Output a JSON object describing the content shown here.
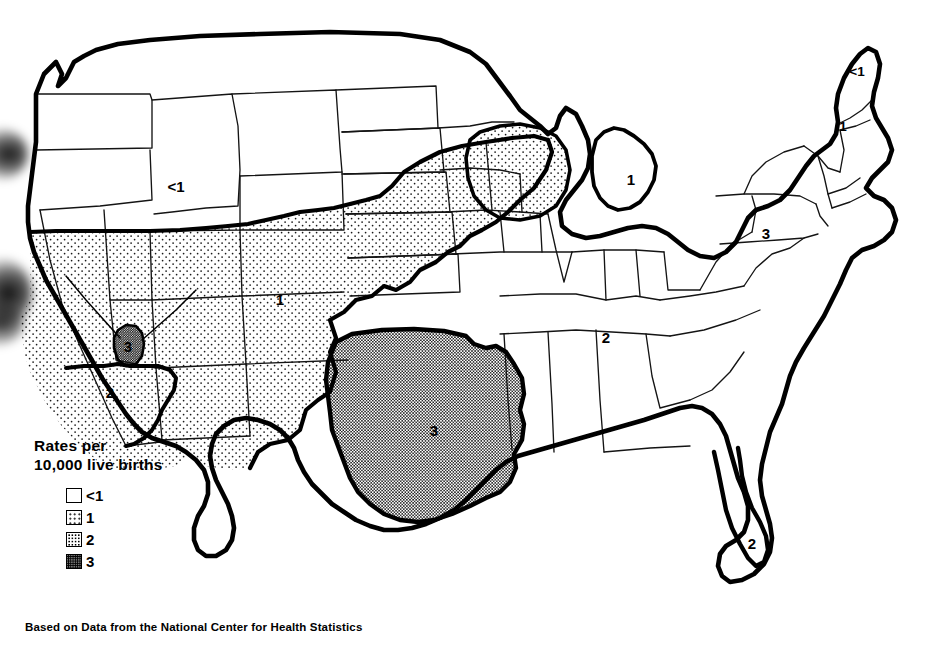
{
  "figure": {
    "kind": "choropleth-map",
    "region": "United States",
    "background_color": "#ffffff",
    "ink_color": "#000000"
  },
  "legend": {
    "title": "Rates per\n10,000 live births",
    "title_line1": "Rates per",
    "title_line2": "10,000 live births",
    "entries": [
      {
        "label": "<1",
        "level": 0,
        "pattern": "white"
      },
      {
        "label": "1",
        "level": 1,
        "pattern": "sparse-dots"
      },
      {
        "label": "2",
        "level": 2,
        "pattern": "medium-dots"
      },
      {
        "label": "3",
        "level": 3,
        "pattern": "dense-dots"
      }
    ]
  },
  "source_note": "Based on Data from the National Center for Health Statistics",
  "map_labels": [
    {
      "id": "pacific-northwest",
      "text": "<1",
      "x": 176,
      "y": 186,
      "size": "normal"
    },
    {
      "id": "great-plains",
      "text": "1",
      "x": 280,
      "y": 299,
      "size": "normal"
    },
    {
      "id": "nevada-small",
      "text": "3",
      "x": 128,
      "y": 346,
      "size": "normal"
    },
    {
      "id": "southern-california",
      "text": "2",
      "x": 110,
      "y": 392,
      "size": "normal"
    },
    {
      "id": "texas-oklahoma",
      "text": "3",
      "x": 434,
      "y": 430,
      "size": "normal"
    },
    {
      "id": "michigan",
      "text": "1",
      "x": 631,
      "y": 179,
      "size": "normal"
    },
    {
      "id": "kentucky",
      "text": "2",
      "x": 606,
      "y": 337,
      "size": "normal"
    },
    {
      "id": "florida",
      "text": "2",
      "x": 752,
      "y": 543,
      "size": "normal"
    },
    {
      "id": "pennsylvania",
      "text": "3",
      "x": 766,
      "y": 233,
      "size": "normal"
    },
    {
      "id": "maine",
      "text": "<1",
      "x": 857,
      "y": 71,
      "size": "small"
    },
    {
      "id": "new-hampshire",
      "text": "1",
      "x": 843,
      "y": 126,
      "size": "small"
    }
  ],
  "chart_data": {
    "type": "map",
    "title": "Rates per 10,000 live births",
    "subtitle": "Based on Data from the National Center for Health Statistics",
    "legend_position": "bottom-left",
    "scale": {
      "kind": "ordinal-choropleth",
      "classes": [
        {
          "label": "<1",
          "level": 0,
          "fill": "white"
        },
        {
          "label": "1",
          "level": 1,
          "fill": "sparse-dots"
        },
        {
          "label": "2",
          "level": 2,
          "fill": "medium-dots"
        },
        {
          "label": "3",
          "level": 3,
          "fill": "dense-dots"
        }
      ]
    },
    "labeled_regions": [
      {
        "region": "Pacific Northwest / Northern Rockies",
        "value": "<1"
      },
      {
        "region": "Great Plains / Mountain West",
        "value": "1"
      },
      {
        "region": "Nevada (small area)",
        "value": "3"
      },
      {
        "region": "Southern California",
        "value": "2"
      },
      {
        "region": "Texas / Oklahoma",
        "value": "3"
      },
      {
        "region": "Michigan",
        "value": "1"
      },
      {
        "region": "Kentucky / Tennessee",
        "value": "2"
      },
      {
        "region": "Florida",
        "value": "2"
      },
      {
        "region": "Pennsylvania",
        "value": "3"
      },
      {
        "region": "Maine",
        "value": "<1"
      },
      {
        "region": "New Hampshire",
        "value": "1"
      }
    ]
  }
}
